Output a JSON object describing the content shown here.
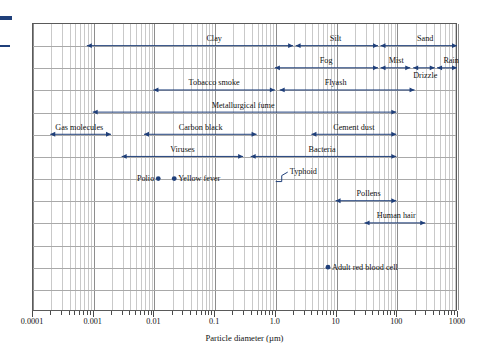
{
  "chart_data": {
    "type": "range-bar",
    "title": "",
    "xlabel": "Particle diameter (µm)",
    "ylabel": "",
    "xscale": "log",
    "xlim": [
      0.0001,
      1000
    ],
    "grid": true,
    "legend": "none",
    "accent_color": "#1f3f7a",
    "tick_labels": [
      "0.0001",
      "0.001",
      "0.01",
      "0.1",
      "1.0",
      "10",
      "100",
      "1000"
    ],
    "tick_values": [
      0.0001,
      0.001,
      0.01,
      0.1,
      1.0,
      10,
      100,
      1000
    ],
    "ranges": [
      {
        "name": "Clay",
        "row": 1,
        "min": 0.0008,
        "max": 2.0,
        "label_x": 0.1,
        "arrow": "both"
      },
      {
        "name": "Silt",
        "row": 1,
        "min": 2.2,
        "max": 50,
        "label_x": 10,
        "arrow": "both"
      },
      {
        "name": "Sand",
        "row": 1,
        "min": 55,
        "max": 1000,
        "label_x": 300,
        "arrow": "both"
      },
      {
        "name": "Fog",
        "row": 2,
        "min": 1.0,
        "max": 50,
        "label_x": 7,
        "arrow": "both"
      },
      {
        "name": "Mist",
        "row": 2,
        "min": 55,
        "max": 170,
        "label_x": 100,
        "arrow": "both"
      },
      {
        "name": "Drizzle",
        "row": 2,
        "min": 190,
        "max": 430,
        "label_x": 300,
        "arrow": "both"
      },
      {
        "name": "Rain",
        "row": 2,
        "min": 470,
        "max": 1000,
        "label_x": 800,
        "arrow": "both"
      },
      {
        "name": "Tobacco smoke",
        "row": 3,
        "min": 0.01,
        "max": 1.0,
        "label_x": 0.1,
        "arrow": "both"
      },
      {
        "name": "Flyash",
        "row": 3,
        "min": 1.2,
        "max": 200,
        "label_x": 10,
        "arrow": "both"
      },
      {
        "name": "Metallurgical fume",
        "row": 4,
        "min": 0.001,
        "max": 100,
        "label_x": 0.3,
        "arrow": "both"
      },
      {
        "name": "Gas molecules",
        "row": 5,
        "min": 0.0002,
        "max": 0.002,
        "label_x": 0.0006,
        "arrow": "both"
      },
      {
        "name": "Carbon black",
        "row": 5,
        "min": 0.007,
        "max": 0.5,
        "label_x": 0.06,
        "arrow": "both"
      },
      {
        "name": "Cement dust",
        "row": 5,
        "min": 4,
        "max": 100,
        "label_x": 20,
        "arrow": "both"
      },
      {
        "name": "Viruses",
        "row": 6,
        "min": 0.003,
        "max": 0.3,
        "label_x": 0.03,
        "arrow": "both"
      },
      {
        "name": "Bacteria",
        "row": 6,
        "min": 0.4,
        "max": 100,
        "label_x": 6,
        "arrow": "both"
      },
      {
        "name": "Pollens",
        "row": 8,
        "min": 10,
        "max": 100,
        "label_x": 35,
        "arrow": "both"
      },
      {
        "name": "Human hair",
        "row": 9,
        "min": 30,
        "max": 300,
        "label_x": 100,
        "arrow": "both"
      }
    ],
    "points": [
      {
        "name": "Polio",
        "row": 7,
        "x": 0.012,
        "label": "Polio",
        "label_side": "left"
      },
      {
        "name": "Yellow fever",
        "row": 7,
        "x": 0.022,
        "label": "Yellow fever",
        "label_side": "right"
      },
      {
        "name": "Adult red blood cell",
        "row": 11,
        "x": 7.5,
        "label": "Adult red blood cell",
        "label_side": "right"
      }
    ],
    "callouts": [
      {
        "name": "Typhoid",
        "row": 7,
        "x": 1.4,
        "label": "Typhoid"
      }
    ]
  },
  "axis": {
    "title": "Particle diameter (µm)"
  }
}
